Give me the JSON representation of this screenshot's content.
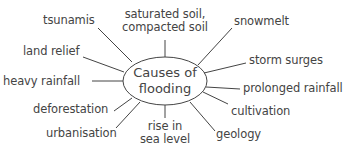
{
  "diagram": {
    "type": "spider-diagram",
    "center": {
      "line1": "Causes of",
      "line2": "flooding"
    },
    "causes": [
      {
        "id": "tsunamis",
        "text": "tsunamis"
      },
      {
        "id": "saturated-soil",
        "line1": "saturated soil,",
        "line2": "compacted soil"
      },
      {
        "id": "snowmelt",
        "text": "snowmelt"
      },
      {
        "id": "land-relief",
        "text": "land relief"
      },
      {
        "id": "storm-surges",
        "text": "storm surges"
      },
      {
        "id": "heavy-rainfall",
        "text": "heavy rainfall"
      },
      {
        "id": "prolonged-rainfall",
        "text": "prolonged rainfall"
      },
      {
        "id": "deforestation",
        "text": "deforestation"
      },
      {
        "id": "cultivation",
        "text": "cultivation"
      },
      {
        "id": "urbanisation",
        "text": "urbanisation"
      },
      {
        "id": "rise-in-sea-level",
        "line1": "rise in",
        "line2": "sea level"
      },
      {
        "id": "geology",
        "text": "geology"
      }
    ],
    "colors": {
      "text": "#444444",
      "stroke": "#444444",
      "background": "#ffffff"
    }
  }
}
